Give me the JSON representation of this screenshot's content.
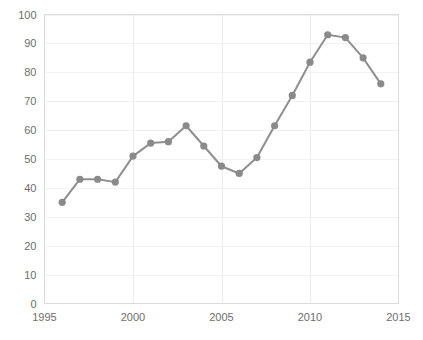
{
  "chart_data": {
    "type": "line",
    "title": "",
    "subtitle": "",
    "xlabel": "",
    "ylabel": "",
    "x": [
      1996,
      1997,
      1998,
      1999,
      2000,
      2001,
      2002,
      2003,
      2004,
      2005,
      2006,
      2007,
      2008,
      2009,
      2010,
      2011,
      2012,
      2013,
      2014
    ],
    "values": [
      35,
      43,
      43,
      42,
      51,
      55.5,
      56,
      61.5,
      54.5,
      47.5,
      45,
      50.5,
      61.5,
      72,
      83.5,
      93,
      92,
      85,
      76
    ],
    "series": [
      {
        "name": "",
        "values": [
          35,
          43,
          43,
          42,
          51,
          55.5,
          56,
          61.5,
          54.5,
          47.5,
          45,
          50.5,
          61.5,
          72,
          83.5,
          93,
          92,
          85,
          76
        ]
      }
    ],
    "xlim": [
      1995,
      2015
    ],
    "ylim": [
      0,
      100
    ],
    "y_ticks": [
      0,
      10,
      20,
      30,
      40,
      50,
      60,
      70,
      80,
      90,
      100
    ],
    "y_tick_labels": [
      "0",
      "10",
      "20",
      "30",
      "40",
      "50",
      "60",
      "70",
      "80",
      "90",
      "100"
    ],
    "x_ticks": [
      1995,
      2000,
      2005,
      2010,
      2015
    ],
    "x_tick_labels": [
      "1995",
      "2000",
      "2005",
      "2010",
      "2015"
    ],
    "grid": true,
    "legend": false,
    "legend_position": "none",
    "marker": "circle",
    "colors": {
      "line": "#8f8f8f",
      "marker": "#8a8a8a",
      "grid": "#f2f2f2",
      "grid_vertical": "#ededed",
      "axis": "#c9c9c9",
      "tick_label": "#6e6e6e",
      "background": "#ffffff"
    }
  },
  "caption": {
    "text": ""
  }
}
